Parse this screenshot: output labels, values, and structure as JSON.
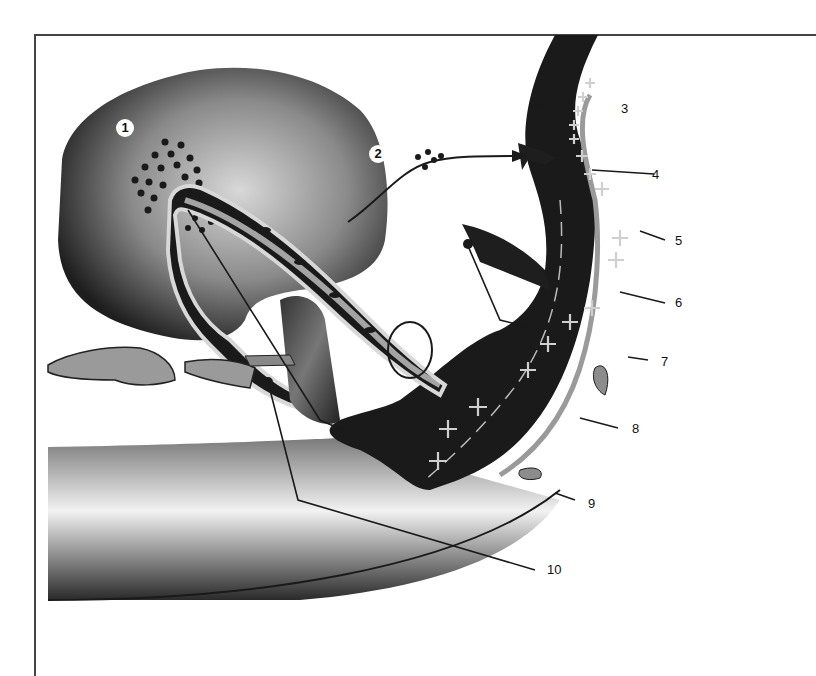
{
  "diagram": {
    "type": "anatomical illustration (numbered callouts)",
    "circled_labels": [
      {
        "id": "c1",
        "text": "1"
      },
      {
        "id": "c2",
        "text": "2"
      }
    ],
    "number_labels": [
      {
        "id": "n3",
        "text": "3"
      },
      {
        "id": "n4",
        "text": "4"
      },
      {
        "id": "n5",
        "text": "5"
      },
      {
        "id": "n6",
        "text": "6"
      },
      {
        "id": "n7",
        "text": "7"
      },
      {
        "id": "n8",
        "text": "8"
      },
      {
        "id": "n9",
        "text": "9"
      },
      {
        "id": "n10",
        "text": "10"
      }
    ],
    "colors": {
      "dark_tissue": "#1a1a1a",
      "mid_gray": "#808080",
      "light_gray": "#d8d8d8",
      "plus_marks": "#c8c8c8",
      "background": "#ffffff"
    }
  }
}
